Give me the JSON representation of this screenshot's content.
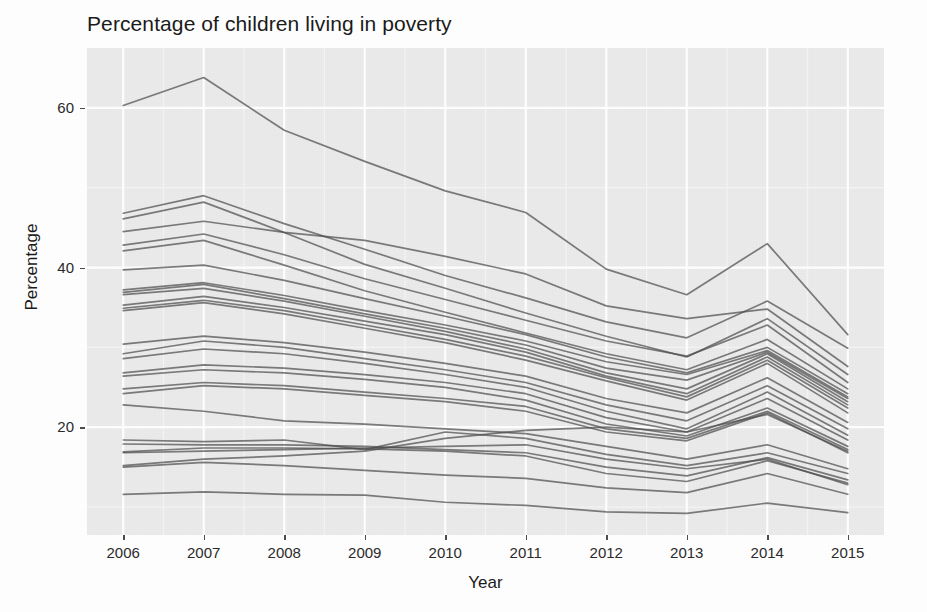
{
  "chart_data": {
    "type": "line",
    "title": "Percentage of children living in poverty",
    "xlabel": "Year",
    "ylabel": "Percentage",
    "x": [
      2006,
      2007,
      2008,
      2009,
      2010,
      2011,
      2012,
      2013,
      2014,
      2015
    ],
    "x_tick_labels": [
      "2006",
      "2007",
      "2008",
      "2009",
      "2010",
      "2011",
      "2012",
      "2013",
      "2014",
      "2015"
    ],
    "y_tick_labels": [
      "20",
      "40",
      "60"
    ],
    "y_ticks": [
      20,
      40,
      60
    ],
    "xlim": [
      2005.55,
      2015.45
    ],
    "ylim": [
      6.5,
      67.5
    ],
    "grid": true,
    "grid_major_color": "#ffffff",
    "grid_minor_color": "#f5f5f5",
    "panel_background": "#ebebeb",
    "line_color": "#4d4d4d",
    "line_opacity": 0.72,
    "legend": "none",
    "legend_position": "none",
    "series": [
      {
        "name": "series-01",
        "values": [
          60.3,
          63.8,
          57.2,
          53.3,
          49.6,
          46.9,
          39.8,
          36.6,
          43.0,
          31.6
        ]
      },
      {
        "name": "series-02",
        "values": [
          46.8,
          49.0,
          45.5,
          42.3,
          39.0,
          36.2,
          33.2,
          31.2,
          35.8,
          29.9
        ]
      },
      {
        "name": "series-03",
        "values": [
          46.1,
          48.2,
          44.4,
          40.4,
          37.4,
          34.3,
          31.4,
          28.8,
          33.6,
          26.6
        ]
      },
      {
        "name": "series-04",
        "values": [
          44.5,
          45.8,
          44.4,
          43.4,
          41.4,
          39.2,
          35.2,
          33.6,
          34.8,
          27.6
        ]
      },
      {
        "name": "series-05",
        "values": [
          42.8,
          44.2,
          41.6,
          38.6,
          36.0,
          33.4,
          30.8,
          28.9,
          32.8,
          25.6
        ]
      },
      {
        "name": "series-06",
        "values": [
          42.1,
          43.4,
          40.3,
          37.1,
          34.4,
          31.8,
          29.2,
          27.2,
          31.0,
          24.8
        ]
      },
      {
        "name": "series-07",
        "values": [
          39.7,
          40.3,
          38.4,
          36.1,
          33.9,
          31.6,
          28.8,
          26.8,
          30.0,
          24.2
        ]
      },
      {
        "name": "series-08",
        "values": [
          37.2,
          38.1,
          36.5,
          34.6,
          32.8,
          30.8,
          28.2,
          26.6,
          29.6,
          23.8
        ]
      },
      {
        "name": "series-09",
        "values": [
          36.9,
          37.9,
          36.1,
          34.2,
          32.4,
          30.3,
          27.4,
          25.9,
          29.4,
          23.6
        ]
      },
      {
        "name": "series-10",
        "values": [
          36.6,
          37.4,
          35.8,
          33.9,
          32.0,
          29.8,
          26.8,
          24.8,
          29.2,
          23.2
        ]
      },
      {
        "name": "series-11",
        "values": [
          35.3,
          36.4,
          35.0,
          33.3,
          31.6,
          29.4,
          26.4,
          24.2,
          28.8,
          22.8
        ]
      },
      {
        "name": "series-12",
        "values": [
          34.9,
          35.9,
          34.6,
          32.8,
          31.0,
          28.9,
          26.2,
          23.8,
          28.4,
          22.4
        ]
      },
      {
        "name": "series-13",
        "values": [
          34.6,
          35.6,
          34.2,
          32.4,
          30.6,
          28.4,
          25.8,
          23.4,
          28.0,
          21.8
        ]
      },
      {
        "name": "series-14",
        "values": [
          30.4,
          31.4,
          30.6,
          29.4,
          28.0,
          26.4,
          23.6,
          21.8,
          26.2,
          20.6
        ]
      },
      {
        "name": "series-15",
        "values": [
          29.2,
          30.8,
          30.0,
          28.6,
          27.2,
          25.6,
          22.8,
          20.8,
          25.2,
          19.8
        ]
      },
      {
        "name": "series-16",
        "values": [
          28.6,
          29.8,
          29.2,
          28.0,
          26.6,
          25.0,
          22.0,
          19.8,
          24.4,
          19.0
        ]
      },
      {
        "name": "series-17",
        "values": [
          26.8,
          27.8,
          27.4,
          26.6,
          25.6,
          24.2,
          21.2,
          19.4,
          23.6,
          18.4
        ]
      },
      {
        "name": "series-18",
        "values": [
          26.4,
          27.2,
          26.8,
          26.0,
          25.0,
          23.4,
          20.4,
          18.9,
          22.4,
          17.6
        ]
      },
      {
        "name": "series-19",
        "values": [
          24.8,
          25.6,
          25.2,
          24.4,
          23.6,
          22.6,
          19.8,
          18.6,
          22.0,
          17.2
        ]
      },
      {
        "name": "series-20",
        "values": [
          24.2,
          25.2,
          24.8,
          24.0,
          23.2,
          22.0,
          19.4,
          18.3,
          21.8,
          16.8
        ]
      },
      {
        "name": "series-21",
        "values": [
          22.8,
          22.0,
          20.8,
          20.4,
          19.8,
          19.2,
          17.6,
          16.0,
          17.8,
          14.8
        ]
      },
      {
        "name": "series-22",
        "values": [
          18.4,
          18.2,
          18.4,
          17.2,
          19.4,
          18.6,
          16.6,
          15.2,
          16.8,
          14.2
        ]
      },
      {
        "name": "series-23",
        "values": [
          17.9,
          17.8,
          17.8,
          17.6,
          17.2,
          16.8,
          15.0,
          13.9,
          16.2,
          13.4
        ]
      },
      {
        "name": "series-24",
        "values": [
          16.9,
          17.4,
          17.4,
          17.3,
          17.0,
          16.4,
          14.2,
          13.2,
          15.8,
          13.0
        ]
      },
      {
        "name": "series-25",
        "values": [
          16.8,
          17.0,
          17.2,
          17.4,
          17.6,
          17.8,
          16.0,
          14.8,
          16.0,
          12.8
        ]
      },
      {
        "name": "series-26",
        "values": [
          15.2,
          16.0,
          16.4,
          17.0,
          18.6,
          19.6,
          20.0,
          19.4,
          21.6,
          17.0
        ]
      },
      {
        "name": "series-27",
        "values": [
          15.0,
          15.6,
          15.2,
          14.6,
          14.0,
          13.6,
          12.4,
          11.8,
          14.2,
          11.6
        ]
      },
      {
        "name": "series-28",
        "values": [
          11.6,
          11.9,
          11.6,
          11.5,
          10.6,
          10.2,
          9.4,
          9.2,
          10.5,
          9.3
        ]
      }
    ]
  }
}
